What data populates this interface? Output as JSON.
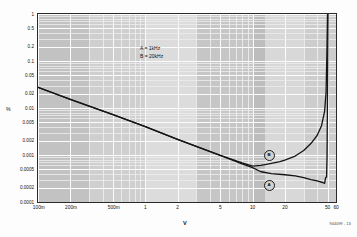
{
  "chart_data": {
    "type": "line",
    "title": "",
    "xlabel": "V",
    "ylabel": "%",
    "xscale": "log",
    "yscale": "log",
    "xlim": [
      0.1,
      60
    ],
    "ylim": [
      0.0001,
      1
    ],
    "grid": true,
    "legend_position": "upper-center",
    "annotations": [
      "A = 1kHz",
      "B = 20kHz"
    ],
    "xticklabels": [
      "100m",
      "200m",
      "500m",
      "1",
      "2",
      "5",
      "10",
      "20",
      "50",
      "60"
    ],
    "xtickvalues": [
      0.1,
      0.2,
      0.5,
      1,
      2,
      5,
      10,
      20,
      50,
      60
    ],
    "yticklabels": [
      "1",
      "0.5",
      "0.2",
      "0.1",
      "0.05",
      "0.02",
      "0.01",
      "0.005",
      "0.002",
      "0.001",
      "0.0005",
      "0.0002",
      "0.0001"
    ],
    "ytickvalues": [
      1,
      0.5,
      0.2,
      0.1,
      0.05,
      0.02,
      0.01,
      0.005,
      0.002,
      0.001,
      0.0005,
      0.0002,
      0.0001
    ],
    "series": [
      {
        "name": "A",
        "label": "A = 1kHz",
        "x": [
          0.1,
          0.2,
          0.5,
          1,
          2,
          5,
          8,
          10,
          12,
          15,
          20,
          25,
          30,
          35,
          40,
          45,
          47,
          48,
          49,
          49.5,
          50,
          50.5
        ],
        "values": [
          0.0275,
          0.0152,
          0.0072,
          0.004,
          0.00215,
          0.00098,
          0.00065,
          0.00054,
          0.00044,
          0.0004,
          0.00038,
          0.00036,
          0.00033,
          0.0003,
          0.00028,
          0.00026,
          0.00025,
          0.00033,
          0.00034,
          0.0009,
          0.02,
          1.0
        ]
      },
      {
        "name": "B",
        "label": "B = 20kHz",
        "x": [
          0.1,
          0.2,
          0.5,
          1,
          2,
          5,
          8,
          10,
          12,
          15,
          18,
          20,
          25,
          30,
          35,
          40,
          44,
          47,
          48.5,
          49.5,
          50
        ],
        "values": [
          0.0275,
          0.0152,
          0.0072,
          0.004,
          0.00215,
          0.00098,
          0.00068,
          0.00058,
          0.0006,
          0.00066,
          0.00072,
          0.00078,
          0.00095,
          0.00125,
          0.00175,
          0.0026,
          0.0042,
          0.0085,
          0.022,
          0.22,
          1.0
        ]
      }
    ]
  },
  "axes": {
    "x_title": "V",
    "y_title": "%"
  },
  "legend": {
    "line_a": "A = 1kHz",
    "line_b": "B = 20kHz"
  },
  "markers": {
    "a": "A",
    "b": "B"
  },
  "footer": {
    "part_code": "944099 - 13"
  }
}
